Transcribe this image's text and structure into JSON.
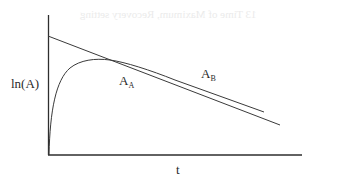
{
  "figure": {
    "y_axis_label": "ln(A)",
    "x_axis_label": "t",
    "curve_label_A": {
      "main": "A",
      "sub": "A"
    },
    "curve_label_B": {
      "main": "A",
      "sub": "B"
    },
    "bleed_through_text": "13 Time of Maximum, Recovery setting"
  },
  "colors": {
    "line": "#3a3a3a",
    "axis": "#2e2e2e",
    "text": "#2a2a2a",
    "background": "#ffffff"
  }
}
